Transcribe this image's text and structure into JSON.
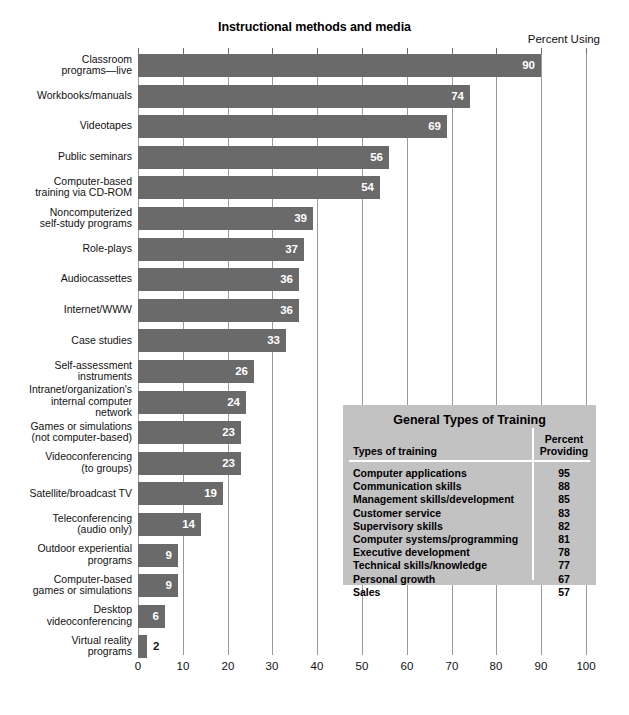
{
  "chart_data": {
    "type": "bar",
    "orientation": "horizontal",
    "title": "Instructional methods and media",
    "value_axis_label": "Percent Using",
    "xlabel": "",
    "ylabel": "",
    "xlim": [
      0,
      100
    ],
    "xticks": [
      0,
      10,
      20,
      30,
      40,
      50,
      60,
      70,
      80,
      90,
      100
    ],
    "grid": true,
    "legend": "none",
    "categories": [
      "Classroom programs—live",
      "Workbooks/manuals",
      "Videotapes",
      "Public seminars",
      "Computer-based training via CD-ROM",
      "Noncomputerized self-study programs",
      "Role-plays",
      "Audiocassettes",
      "Internet/WWW",
      "Case studies",
      "Self-assessment instruments",
      "Intranet/organization's internal computer network",
      "Games or simulations (not computer-based)",
      "Videoconferencing (to groups)",
      "Satellite/broadcast TV",
      "Teleconferencing (audio only)",
      "Outdoor experiential programs",
      "Computer-based games or simulations",
      "Desktop videoconferencing",
      "Virtual reality programs"
    ],
    "values": [
      90,
      74,
      69,
      56,
      54,
      39,
      37,
      36,
      36,
      33,
      26,
      24,
      23,
      23,
      19,
      14,
      9,
      9,
      6,
      2
    ],
    "bar_color": "#6a6a6a",
    "label_color_inside": "#ffffff",
    "label_color_outside": "#1a1a1a"
  },
  "bars": [
    {
      "label_lines": [
        "Classroom",
        "programs—live"
      ],
      "value": 90
    },
    {
      "label_lines": [
        "Workbooks/manuals"
      ],
      "value": 74
    },
    {
      "label_lines": [
        "Videotapes"
      ],
      "value": 69
    },
    {
      "label_lines": [
        "Public seminars"
      ],
      "value": 56
    },
    {
      "label_lines": [
        "Computer-based",
        "training via CD-ROM"
      ],
      "value": 54
    },
    {
      "label_lines": [
        "Noncomputerized",
        "self-study programs"
      ],
      "value": 39
    },
    {
      "label_lines": [
        "Role-plays"
      ],
      "value": 37
    },
    {
      "label_lines": [
        "Audiocassettes"
      ],
      "value": 36
    },
    {
      "label_lines": [
        "Internet/WWW"
      ],
      "value": 36
    },
    {
      "label_lines": [
        "Case studies"
      ],
      "value": 33
    },
    {
      "label_lines": [
        "Self-assessment",
        "instruments"
      ],
      "value": 26
    },
    {
      "label_lines": [
        "Intranet/organization's",
        "internal computer",
        "network"
      ],
      "value": 24
    },
    {
      "label_lines": [
        "Games or simulations",
        "(not computer-based)"
      ],
      "value": 23
    },
    {
      "label_lines": [
        "Videoconferencing",
        "(to groups)"
      ],
      "value": 23
    },
    {
      "label_lines": [
        "Satellite/broadcast TV"
      ],
      "value": 19
    },
    {
      "label_lines": [
        "Teleconferencing",
        "(audio only)"
      ],
      "value": 14
    },
    {
      "label_lines": [
        "Outdoor experiential",
        "programs"
      ],
      "value": 9
    },
    {
      "label_lines": [
        "Computer-based",
        "games or simulations"
      ],
      "value": 9
    },
    {
      "label_lines": [
        "Desktop",
        "videoconferencing"
      ],
      "value": 6
    },
    {
      "label_lines": [
        "Virtual reality",
        "programs"
      ],
      "value": 2
    }
  ],
  "inset_table": {
    "title": "General Types of Training",
    "header_left": "Types of training",
    "header_right_line1": "Percent",
    "header_right_line2": "Providing",
    "background_color": "#c2c2c2",
    "rows": [
      {
        "name": "Computer applications",
        "percent": "95"
      },
      {
        "name": "Communication skills",
        "percent": "88"
      },
      {
        "name": "Management skills/development",
        "percent": "85"
      },
      {
        "name": "Customer service",
        "percent": "83"
      },
      {
        "name": "Supervisory skills",
        "percent": "82"
      },
      {
        "name": "Computer systems/programming",
        "percent": "81"
      },
      {
        "name": "Executive development",
        "percent": "78"
      },
      {
        "name": "Technical skills/knowledge",
        "percent": "77"
      },
      {
        "name": "Personal growth",
        "percent": "67"
      },
      {
        "name": "Sales",
        "percent": "57"
      }
    ]
  }
}
